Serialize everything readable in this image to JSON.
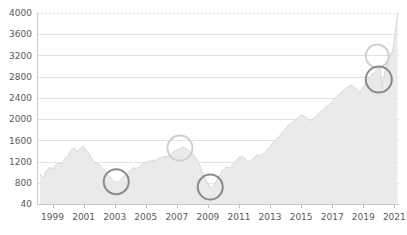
{
  "chart_data": {
    "type": "area",
    "title": "",
    "subtitle": "",
    "xlabel": "",
    "ylabel": "",
    "grid": true,
    "legend_position": "none",
    "xlim": [
      1998.0,
      2021.3
    ],
    "ylim": [
      400,
      4000
    ],
    "y_ticks": [
      400,
      800,
      1200,
      1600,
      2000,
      2400,
      2800,
      3200,
      3600,
      4000
    ],
    "y_tick_labels": [
      "40",
      "800",
      "1200",
      "1600",
      "2000",
      "2400",
      "2800",
      "3200",
      "3600",
      "4000"
    ],
    "x_ticks": [
      1999,
      2001,
      2003,
      2005,
      2007,
      2009,
      2011,
      2013,
      2015,
      2017,
      2019,
      2021
    ],
    "x_tick_labels": [
      "1999",
      "2001",
      "2003",
      "2005",
      "2007",
      "2009",
      "2011",
      "2013",
      "2015",
      "2017",
      "2019",
      "2021"
    ],
    "colors": {
      "fill": "#e9e9e9",
      "line": "#cfcfcf",
      "grid": "#e2e2e2",
      "axis": "#c9c9c9",
      "tick_text": "#5a5a5a",
      "annotation_dark": "#8a8a8a",
      "annotation_light": "#cfcfcf"
    },
    "series": [
      {
        "name": "index",
        "x": [
          1998.2,
          1998.4,
          1998.6,
          1998.8,
          1999.0,
          1999.2,
          1999.4,
          1999.6,
          1999.8,
          2000.0,
          2000.2,
          2000.4,
          2000.6,
          2000.8,
          2001.0,
          2001.2,
          2001.4,
          2001.6,
          2001.8,
          2002.0,
          2002.2,
          2002.4,
          2002.6,
          2002.8,
          2003.0,
          2003.2,
          2003.4,
          2003.6,
          2003.8,
          2004.0,
          2004.2,
          2004.4,
          2004.6,
          2004.8,
          2005.0,
          2005.2,
          2005.4,
          2005.6,
          2005.8,
          2006.0,
          2006.2,
          2006.4,
          2006.6,
          2006.8,
          2007.0,
          2007.2,
          2007.4,
          2007.6,
          2007.8,
          2008.0,
          2008.2,
          2008.4,
          2008.6,
          2008.8,
          2009.0,
          2009.2,
          2009.4,
          2009.6,
          2009.8,
          2010.0,
          2010.2,
          2010.4,
          2010.6,
          2010.8,
          2011.0,
          2011.2,
          2011.4,
          2011.6,
          2011.8,
          2012.0,
          2012.2,
          2012.4,
          2012.6,
          2012.8,
          2013.0,
          2013.2,
          2013.4,
          2013.6,
          2013.8,
          2014.0,
          2014.2,
          2014.4,
          2014.6,
          2014.8,
          2015.0,
          2015.2,
          2015.4,
          2015.6,
          2015.8,
          2016.0,
          2016.2,
          2016.4,
          2016.6,
          2016.8,
          2017.0,
          2017.2,
          2017.4,
          2017.6,
          2017.8,
          2018.0,
          2018.2,
          2018.4,
          2018.6,
          2018.8,
          2019.0,
          2019.2,
          2019.4,
          2019.6,
          2019.8,
          2020.0,
          2020.1,
          2020.2,
          2020.3,
          2020.4,
          2020.5,
          2020.6,
          2020.7,
          2020.8,
          2020.9,
          2021.0,
          2021.1,
          2021.2
        ],
        "y": [
          960,
          900,
          1020,
          1090,
          1060,
          1130,
          1180,
          1160,
          1250,
          1310,
          1420,
          1460,
          1380,
          1450,
          1490,
          1400,
          1330,
          1220,
          1170,
          1150,
          1080,
          1020,
          940,
          870,
          820,
          800,
          860,
          930,
          980,
          1030,
          1090,
          1060,
          1110,
          1160,
          1180,
          1200,
          1230,
          1210,
          1260,
          1270,
          1300,
          1290,
          1340,
          1390,
          1420,
          1450,
          1470,
          1440,
          1400,
          1350,
          1280,
          1180,
          1040,
          900,
          780,
          700,
          760,
          860,
          960,
          1050,
          1100,
          1080,
          1140,
          1210,
          1280,
          1300,
          1260,
          1190,
          1230,
          1280,
          1330,
          1310,
          1360,
          1420,
          1480,
          1560,
          1620,
          1680,
          1750,
          1820,
          1890,
          1930,
          1980,
          2030,
          2080,
          2060,
          2010,
          1960,
          2010,
          2060,
          2120,
          2180,
          2230,
          2270,
          2330,
          2400,
          2460,
          2510,
          2560,
          2600,
          2640,
          2610,
          2560,
          2500,
          2620,
          2720,
          2790,
          2850,
          2900,
          2960,
          3000,
          2600,
          2750,
          2900,
          3020,
          3100,
          3160,
          3220,
          3300,
          3480,
          3700,
          3980
        ]
      }
    ],
    "annotations": [
      {
        "name": "circle-2003-trough",
        "x": 2003.1,
        "y": 820,
        "radius_px": 12.5,
        "style": "dark"
      },
      {
        "name": "circle-2007-peak",
        "x": 2007.2,
        "y": 1455,
        "radius_px": 12.5,
        "style": "light"
      },
      {
        "name": "circle-2009-trough",
        "x": 2009.15,
        "y": 720,
        "radius_px": 12.5,
        "style": "dark"
      },
      {
        "name": "circle-2019-upper",
        "x": 2019.9,
        "y": 3190,
        "radius_px": 11.5,
        "style": "light"
      },
      {
        "name": "circle-2020-lower",
        "x": 2020.0,
        "y": 2745,
        "radius_px": 13.0,
        "style": "dark"
      }
    ]
  }
}
